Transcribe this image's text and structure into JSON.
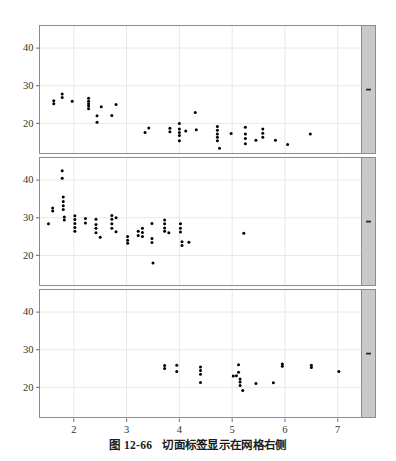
{
  "figure": {
    "caption_label": "图 12-66",
    "caption_text": "切面标签显示在网格右侧",
    "background": "#ffffff",
    "panel_bg": "#ffffff",
    "grid_color": "#e8e8ea",
    "border_color": "#8c8c8c",
    "strip_fill": "#c9c9c9",
    "point_color": "#000000",
    "axis_text_color": "#333333"
  },
  "chart_data": {
    "type": "scatter",
    "title": "",
    "subtitle": "",
    "xlabel": "",
    "ylabel": "",
    "grid": true,
    "legend": "none",
    "layout": "3 stacked panels (trellis / lattice), strip labels on right side of each panel",
    "xlim": [
      1.35,
      7.45
    ],
    "ylim": [
      12.0,
      46.0
    ],
    "xticks": [
      2,
      3,
      4,
      5,
      6,
      7
    ],
    "yticks": [
      20,
      30,
      40
    ],
    "xtick_labels": [
      "2",
      "3",
      "4",
      "5",
      "6",
      "7"
    ],
    "ytick_labels": [
      "20",
      "30",
      "40"
    ],
    "panels": [
      {
        "index": 1,
        "strip_label": "",
        "points": [
          [
            1.62,
            25.2
          ],
          [
            1.62,
            26.0
          ],
          [
            1.78,
            27.8
          ],
          [
            1.78,
            26.9
          ],
          [
            1.97,
            25.9
          ],
          [
            2.28,
            26.7
          ],
          [
            2.28,
            25.9
          ],
          [
            2.28,
            25.2
          ],
          [
            2.28,
            24.6
          ],
          [
            2.28,
            23.9
          ],
          [
            2.44,
            22.0
          ],
          [
            2.44,
            20.3
          ],
          [
            2.52,
            24.4
          ],
          [
            2.72,
            22.1
          ],
          [
            2.8,
            25.0
          ],
          [
            3.35,
            17.6
          ],
          [
            3.42,
            18.8
          ],
          [
            3.82,
            18.7
          ],
          [
            3.82,
            17.8
          ],
          [
            4.0,
            20.0
          ],
          [
            4.0,
            18.5
          ],
          [
            4.0,
            17.6
          ],
          [
            4.0,
            16.8
          ],
          [
            4.0,
            15.4
          ],
          [
            4.12,
            18.0
          ],
          [
            4.3,
            22.9
          ],
          [
            4.32,
            18.3
          ],
          [
            4.72,
            19.2
          ],
          [
            4.72,
            18.2
          ],
          [
            4.72,
            17.2
          ],
          [
            4.72,
            16.3
          ],
          [
            4.72,
            15.4
          ],
          [
            4.76,
            13.4
          ],
          [
            4.98,
            17.3
          ],
          [
            5.25,
            19.0
          ],
          [
            5.25,
            17.2
          ],
          [
            5.25,
            16.0
          ],
          [
            5.25,
            14.6
          ],
          [
            5.45,
            15.5
          ],
          [
            5.58,
            18.5
          ],
          [
            5.58,
            17.4
          ],
          [
            5.58,
            16.3
          ],
          [
            5.82,
            15.5
          ],
          [
            6.05,
            14.4
          ],
          [
            6.48,
            17.2
          ]
        ]
      },
      {
        "index": 2,
        "strip_label": "",
        "points": [
          [
            1.52,
            28.4
          ],
          [
            1.6,
            32.6
          ],
          [
            1.6,
            31.8
          ],
          [
            1.78,
            42.5
          ],
          [
            1.78,
            40.5
          ],
          [
            1.8,
            35.5
          ],
          [
            1.8,
            34.3
          ],
          [
            1.8,
            33.2
          ],
          [
            1.8,
            32.2
          ],
          [
            1.82,
            30.2
          ],
          [
            1.82,
            29.4
          ],
          [
            2.02,
            30.5
          ],
          [
            2.02,
            29.5
          ],
          [
            2.02,
            28.5
          ],
          [
            2.02,
            27.4
          ],
          [
            2.02,
            26.4
          ],
          [
            2.22,
            29.8
          ],
          [
            2.22,
            28.6
          ],
          [
            2.42,
            29.6
          ],
          [
            2.42,
            28.2
          ],
          [
            2.42,
            27.2
          ],
          [
            2.42,
            26.0
          ],
          [
            2.5,
            24.8
          ],
          [
            2.72,
            30.6
          ],
          [
            2.72,
            29.6
          ],
          [
            2.72,
            28.4
          ],
          [
            2.72,
            27.2
          ],
          [
            2.8,
            30.0
          ],
          [
            2.8,
            26.3
          ],
          [
            3.02,
            25.0
          ],
          [
            3.02,
            24.0
          ],
          [
            3.02,
            23.2
          ],
          [
            3.22,
            26.4
          ],
          [
            3.22,
            25.3
          ],
          [
            3.3,
            27.2
          ],
          [
            3.3,
            26.1
          ],
          [
            3.3,
            25.0
          ],
          [
            3.48,
            28.5
          ],
          [
            3.48,
            24.5
          ],
          [
            3.48,
            23.4
          ],
          [
            3.5,
            18.0
          ],
          [
            3.72,
            29.4
          ],
          [
            3.72,
            28.4
          ],
          [
            3.72,
            27.3
          ],
          [
            3.72,
            26.4
          ],
          [
            3.8,
            26.0
          ],
          [
            4.02,
            28.4
          ],
          [
            4.02,
            27.2
          ],
          [
            4.02,
            26.2
          ],
          [
            4.05,
            23.6
          ],
          [
            4.05,
            22.6
          ],
          [
            4.18,
            23.5
          ],
          [
            5.22,
            25.9
          ]
        ]
      },
      {
        "index": 3,
        "strip_label": "",
        "points": [
          [
            3.72,
            25.8
          ],
          [
            3.72,
            25.0
          ],
          [
            3.95,
            25.9
          ],
          [
            3.95,
            24.2
          ],
          [
            4.4,
            25.4
          ],
          [
            4.4,
            24.5
          ],
          [
            4.4,
            23.5
          ],
          [
            4.4,
            21.3
          ],
          [
            5.02,
            23.0
          ],
          [
            5.08,
            23.1
          ],
          [
            5.12,
            26.0
          ],
          [
            5.12,
            24.0
          ],
          [
            5.15,
            22.2
          ],
          [
            5.15,
            21.4
          ],
          [
            5.15,
            20.5
          ],
          [
            5.2,
            19.2
          ],
          [
            5.45,
            21.0
          ],
          [
            5.78,
            21.2
          ],
          [
            5.95,
            26.2
          ],
          [
            5.95,
            25.6
          ],
          [
            6.5,
            25.9
          ],
          [
            6.5,
            25.3
          ],
          [
            7.02,
            24.2
          ]
        ]
      }
    ]
  }
}
